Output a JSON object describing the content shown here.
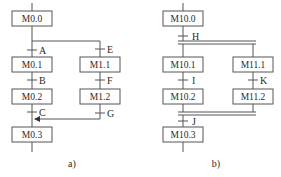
{
  "diagram_a": {
    "caption": "a)",
    "steps": [
      "M0.0",
      "M0.1",
      "M0.2",
      "M0.3",
      "M1.1",
      "M1.2"
    ],
    "transitions": [
      "A",
      "B",
      "C",
      "E",
      "F",
      "G"
    ],
    "type": "selective-branch"
  },
  "diagram_b": {
    "caption": "b)",
    "steps": [
      "M10.0",
      "M10.1",
      "M10.2",
      "M10.3",
      "M11.1",
      "M11.2"
    ],
    "transitions": [
      "H",
      "I",
      "J",
      "K"
    ],
    "type": "parallel-branch"
  },
  "colors": {
    "line": "#555555",
    "box_border": "#555555",
    "text": "#2b2b2b",
    "background": "#ffffff"
  }
}
